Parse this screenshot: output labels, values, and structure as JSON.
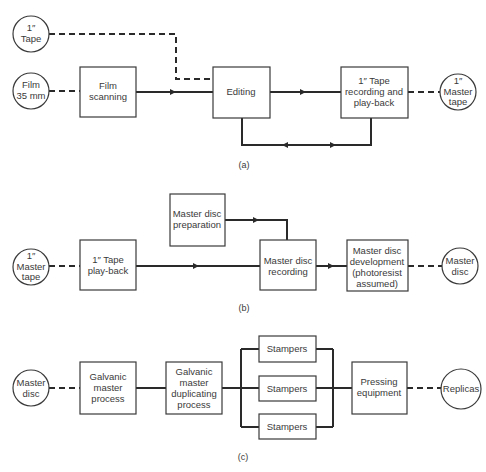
{
  "diagrams": {
    "a": {
      "caption": "(a)",
      "nodes": {
        "tape_in": [
          "1″",
          "Tape"
        ],
        "film_in": [
          "Film",
          "35 mm"
        ],
        "film_scanning": [
          "Film",
          "scanning"
        ],
        "editing": [
          "Editing"
        ],
        "tape_recording": [
          "1″ Tape",
          "recording and",
          "play-back"
        ],
        "master_tape_out": [
          "1″",
          "Master",
          "tape"
        ]
      }
    },
    "b": {
      "caption": "(b)",
      "nodes": {
        "master_tape_in": [
          "1″",
          "Master",
          "tape"
        ],
        "tape_playback": [
          "1″ Tape",
          "play-back"
        ],
        "disc_preparation": [
          "Master disc",
          "preparation"
        ],
        "disc_recording": [
          "Master disc",
          "recording"
        ],
        "disc_development": [
          "Master disc",
          "development",
          "(photoresist",
          "assumed)"
        ],
        "master_disc_out": [
          "Master",
          "disc"
        ]
      }
    },
    "c": {
      "caption": "(c)",
      "nodes": {
        "master_disc_in": [
          "Master",
          "disc"
        ],
        "galvanic_master": [
          "Galvanic",
          "master",
          "process"
        ],
        "galvanic_duplicating": [
          "Galvanic",
          "master",
          "duplicating",
          "process"
        ],
        "stampers_1": [
          "Stampers"
        ],
        "stampers_2": [
          "Stampers"
        ],
        "stampers_3": [
          "Stampers"
        ],
        "pressing": [
          "Pressing",
          "equipment"
        ],
        "replicas_out": [
          "Replicas"
        ]
      }
    }
  }
}
